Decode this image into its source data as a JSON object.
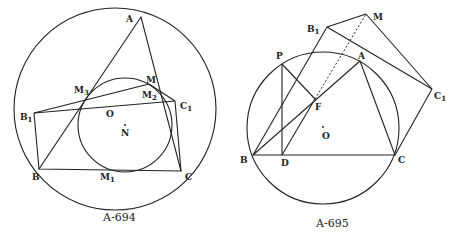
{
  "figures": [
    {
      "caption": "A-694",
      "labels": {
        "A": "A",
        "B": "B",
        "C": "C",
        "B1": "B",
        "B1_sub": "1",
        "C1": "C",
        "C1_sub": "1",
        "M": "M",
        "M1": "M",
        "M1_sub": "1",
        "M2": "M",
        "M2_sub": "2",
        "M3": "M",
        "M3_sub": "3",
        "O": "O",
        "N": "N"
      }
    },
    {
      "caption": "A-695",
      "labels": {
        "A": "A",
        "B": "B",
        "C": "C",
        "D": "D",
        "P": "P",
        "F": "F",
        "O": "O",
        "M": "M",
        "B1": "B",
        "B1_sub": "1",
        "C1": "C",
        "C1_sub": "1"
      }
    }
  ]
}
